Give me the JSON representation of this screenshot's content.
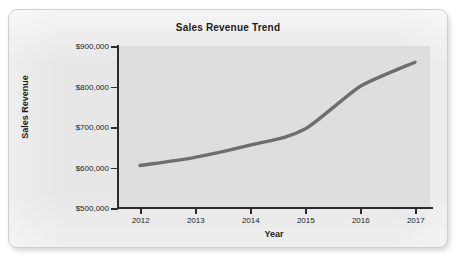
{
  "chart_data": {
    "type": "line",
    "title": "Sales Revenue Trend",
    "xlabel": "Year",
    "ylabel": "Sales Revenue",
    "categories": [
      "2012",
      "2013",
      "2014",
      "2015",
      "2016",
      "2017"
    ],
    "x": [
      2012,
      2013,
      2014,
      2015,
      2016,
      2017
    ],
    "values": [
      605000,
      625000,
      655000,
      695000,
      800000,
      860000
    ],
    "series": [
      {
        "name": "Sales Revenue",
        "values": [
          605000,
          625000,
          655000,
          695000,
          800000,
          860000
        ]
      }
    ],
    "ylim": [
      500000,
      900000
    ],
    "ytick_values": [
      900000,
      800000,
      700000,
      600000,
      500000
    ],
    "ytick_labels": [
      "$900,000",
      "$800,000",
      "$700,000",
      "$600,000",
      "$500,000"
    ],
    "xtick_labels": [
      "2012",
      "2013",
      "2014",
      "2015",
      "2016",
      "2017"
    ],
    "grid": false,
    "legend": null,
    "legend_position": "none",
    "line_color": "#6e6e6e",
    "plot_background": "#dedede",
    "card_background": "#e7e7e7",
    "axis_color": "#2b2b2b",
    "text_color": "#1c1c1c",
    "smoothing": "curved",
    "marker": "none"
  }
}
